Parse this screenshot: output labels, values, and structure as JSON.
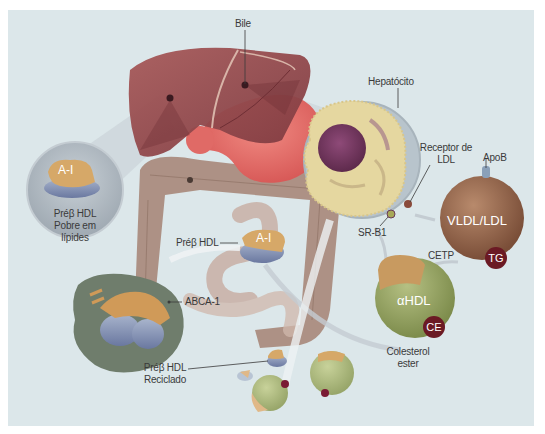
{
  "labels": {
    "bile": "Bile",
    "hepatocyte": "Hepatócito",
    "ldl_receptor_line1": "Receptor de",
    "ldl_receptor_line2": "LDL",
    "apob": "ApoB",
    "sr_b1": "SR-B1",
    "cetp": "CETP",
    "prebeta_poor_line1": "Préβ HDL",
    "prebeta_poor_line2": "Pobre em",
    "prebeta_poor_line3": "lípides",
    "prebeta_hdl": "Préβ HDL",
    "abca1": "ABCA-1",
    "recycled_line1": "Préβ HDL",
    "recycled_line2": "Reciclado",
    "cholesterol_ester_line1": "Colesterol",
    "cholesterol_ester_line2": "ester"
  },
  "particles": {
    "a1_inset": "A-I",
    "a1_mid": "A-I",
    "vldl_ldl": "VLDL/LDL",
    "tg": "TG",
    "alpha_hdl": "αHDL",
    "ce": "CE"
  },
  "colors": {
    "background": "#dce7ea",
    "liver": "#9a4a4c",
    "stomach": "#e86a66",
    "intestine": "#a88a7c",
    "hepatocyte": "#e5d7a0",
    "nucleus": "#7a3a62",
    "vldl": "#9a6a4e",
    "hdl": "#9aa868",
    "apo_a1": "#d6a868",
    "apo_blue": "#8a9ab8",
    "badge": "#6b1a24",
    "macrophage": "#6f7d6c"
  }
}
